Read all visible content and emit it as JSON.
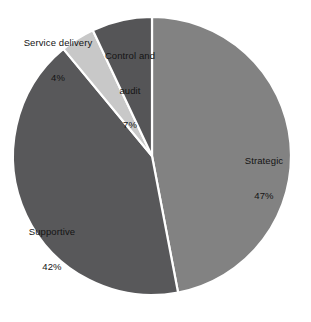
{
  "chart_data": {
    "type": "pie",
    "title": "",
    "subtitle": "",
    "xlabel": "",
    "ylabel": "",
    "legend_position": "none",
    "grid": false,
    "start_angle_deg": 0,
    "direction": "clockwise",
    "center": {
      "x": 152,
      "y": 156
    },
    "radius": 139,
    "background_color": "#ffffff",
    "separator_color": "#ffffff",
    "label_color": "#141414",
    "categories": [
      "Strategic",
      "Supportive",
      "Service delivery",
      "Control and audit"
    ],
    "values": [
      47,
      42,
      4,
      7
    ],
    "value_suffix": "%",
    "slices": [
      {
        "name": "Strategic",
        "label_line1": "Strategic",
        "label_line2": "47%",
        "value": 47,
        "color": "#828282"
      },
      {
        "name": "Supportive",
        "label_line1": "Supportive",
        "label_line2": "42%",
        "value": 42,
        "color": "#58585a"
      },
      {
        "name": "Service delivery",
        "label_line1": "Service delivery",
        "label_line2": "4%",
        "value": 4,
        "color": "#c8c8c8"
      },
      {
        "name": "Control and audit",
        "label_line1": "Control and",
        "label_line2": "audit",
        "label_line3": "7%",
        "value": 7,
        "color": "#555557"
      }
    ]
  },
  "labels": {
    "strategic": {
      "name": "Strategic",
      "value": "47%"
    },
    "supportive": {
      "name": "Supportive",
      "value": "42%"
    },
    "service_delivery": {
      "name": "Service delivery",
      "value": "4%"
    },
    "control_and_audit": {
      "name_line1": "Control and",
      "name_line2": "audit",
      "value": "7%"
    }
  }
}
